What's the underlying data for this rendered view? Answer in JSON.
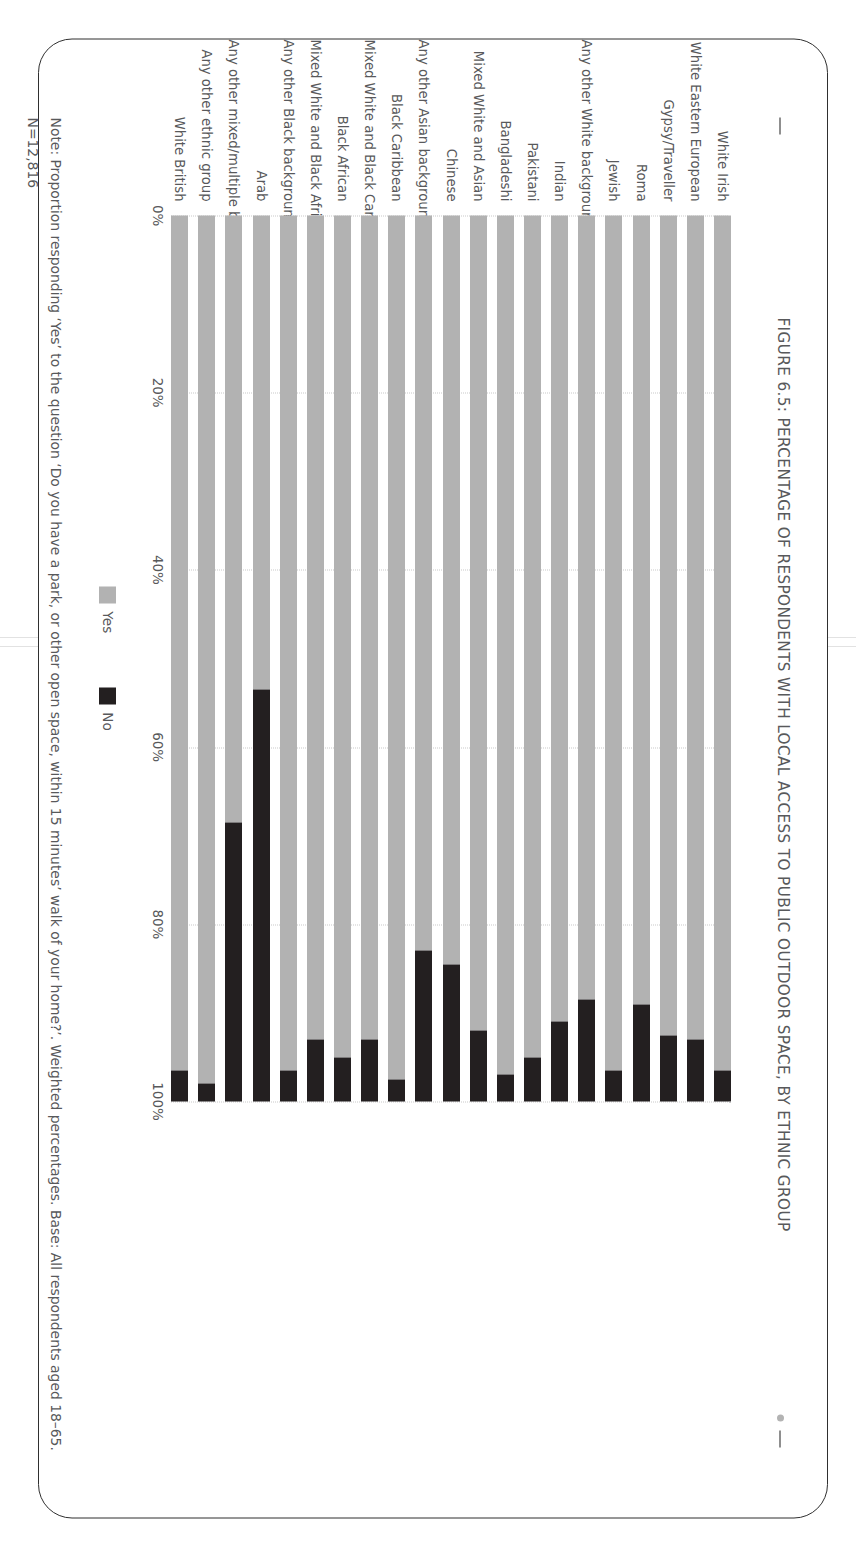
{
  "figure": {
    "title": "FIGURE 6.5: PERCENTAGE OF RESPONDENTS WITH LOCAL ACCESS TO PUBLIC OUTDOOR SPACE, BY ETHNIC GROUP",
    "note": "Note: Proportion responding ‘Yes’ to the question ‘Do you have a park, or other open space, within 15 minutes’ walk of your home?’. Weighted percentages. Base: All respondents aged 18–65. N=12,816",
    "leader_dash": "—",
    "bullet_dot": "•"
  },
  "legend": {
    "position": "bottom",
    "items": [
      {
        "label": "Yes",
        "color": "#b2b2b2"
      },
      {
        "label": "No",
        "color": "#231f20"
      }
    ]
  },
  "axis": {
    "ticks": [
      "0%",
      "20%",
      "40%",
      "60%",
      "80%",
      "100%"
    ],
    "tick_values": [
      0,
      20,
      40,
      60,
      80,
      100
    ]
  },
  "colors": {
    "yes": "#b2b2b2",
    "no": "#231f20",
    "text": "#58595b",
    "border": "#2f2f2f",
    "grid": "#c9c9c9"
  },
  "chart_data": {
    "type": "bar",
    "orientation": "horizontal-stacked",
    "title": "FIGURE 6.5: PERCENTAGE OF RESPONDENTS WITH LOCAL ACCESS TO PUBLIC OUTDOOR SPACE, BY ETHNIC GROUP",
    "xlabel": "",
    "ylabel": "",
    "xlim": [
      0,
      100
    ],
    "grid": true,
    "stacked": true,
    "categories": [
      "White Irish",
      "White Eastern European",
      "Gypsy/Traveller",
      "Roma",
      "Jewish",
      "Any other White background",
      "Indian",
      "Pakistani",
      "Bangladeshi",
      "Mixed White and Asian",
      "Chinese",
      "Any other Asian background",
      "Black Caribbean",
      "Mixed White and Black Caribbean",
      "Black African",
      "Mixed White and Black African",
      "Any other Black background",
      "Arab",
      "Any other mixed/multiple background",
      "Any other ethnic group",
      "White British"
    ],
    "series": [
      {
        "name": "Yes",
        "color": "#b2b2b2",
        "values": [
          96.5,
          93.0,
          92.5,
          89.0,
          96.5,
          88.5,
          91.0,
          95.0,
          97.0,
          92.0,
          84.5,
          83.0,
          97.5,
          93.0,
          95.0,
          93.0,
          96.5,
          53.5,
          68.5,
          98.0,
          96.5
        ]
      },
      {
        "name": "No",
        "color": "#231f20",
        "values": [
          3.5,
          7.0,
          7.5,
          11.0,
          3.5,
          11.5,
          9.0,
          5.0,
          3.0,
          8.0,
          15.5,
          17.0,
          2.5,
          7.0,
          5.0,
          7.0,
          3.5,
          46.5,
          31.5,
          2.0,
          3.5
        ]
      }
    ]
  }
}
